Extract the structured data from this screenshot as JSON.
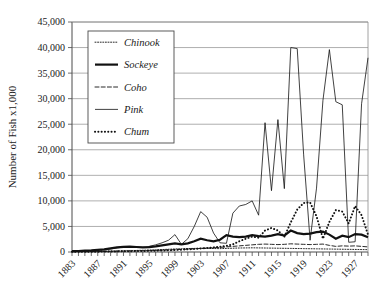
{
  "chart_data": {
    "type": "line",
    "title": "",
    "xlabel": "",
    "ylabel": "Number of Fish x1,000",
    "ylim": [
      0,
      45000
    ],
    "xlim": [
      1883,
      1929
    ],
    "ytick_labels": [
      "0",
      "5,000",
      "10,000",
      "15,000",
      "20,000",
      "25,000",
      "30,000",
      "35,000",
      "40,000",
      "45,000"
    ],
    "ytick_values": [
      0,
      5000,
      10000,
      15000,
      20000,
      25000,
      30000,
      35000,
      40000,
      45000
    ],
    "xtick_labels": [
      "1883",
      "1887",
      "1891",
      "1895",
      "1899",
      "1903",
      "1907",
      "1911",
      "1915",
      "1919",
      "1923",
      "1927"
    ],
    "xtick_values": [
      1883,
      1887,
      1891,
      1895,
      1899,
      1903,
      1907,
      1911,
      1915,
      1919,
      1923,
      1927
    ],
    "grid": true,
    "legend_position": "upper-left-inside",
    "x": [
      1883,
      1884,
      1885,
      1886,
      1887,
      1888,
      1889,
      1890,
      1891,
      1892,
      1893,
      1894,
      1895,
      1896,
      1897,
      1898,
      1899,
      1900,
      1901,
      1902,
      1903,
      1904,
      1905,
      1906,
      1907,
      1908,
      1909,
      1910,
      1911,
      1912,
      1913,
      1914,
      1915,
      1916,
      1917,
      1918,
      1919,
      1920,
      1921,
      1922,
      1923,
      1924,
      1925,
      1926,
      1927,
      1928,
      1929
    ],
    "series": [
      {
        "name": "Chinook",
        "style": "fine-dotted",
        "values": [
          80,
          90,
          100,
          120,
          140,
          160,
          180,
          200,
          230,
          260,
          300,
          340,
          380,
          420,
          480,
          540,
          600,
          640,
          680,
          700,
          720,
          700,
          680,
          660,
          700,
          740,
          780,
          800,
          820,
          800,
          780,
          760,
          740,
          720,
          700,
          680,
          660,
          640,
          620,
          600,
          580,
          560,
          540,
          520,
          500,
          480,
          460
        ]
      },
      {
        "name": "Sockeye",
        "style": "thick-solid",
        "values": [
          180,
          200,
          260,
          320,
          420,
          520,
          700,
          900,
          1000,
          1050,
          980,
          900,
          950,
          1100,
          1300,
          1500,
          1700,
          1500,
          1700,
          2100,
          2600,
          2300,
          2100,
          2400,
          3300,
          3000,
          2900,
          3000,
          3300,
          3100,
          3000,
          3200,
          3500,
          3200,
          4200,
          3700,
          3500,
          3600,
          3900,
          4000,
          3400,
          2600,
          3200,
          2900,
          3500,
          3400,
          2900
        ]
      },
      {
        "name": "Coho",
        "style": "dashed",
        "values": [
          40,
          50,
          60,
          70,
          90,
          110,
          130,
          150,
          170,
          190,
          210,
          240,
          280,
          320,
          360,
          400,
          450,
          500,
          560,
          620,
          700,
          760,
          820,
          900,
          1000,
          1100,
          1200,
          1300,
          1400,
          1500,
          1550,
          1500,
          1450,
          1500,
          1600,
          1550,
          1500,
          1450,
          1500,
          1550,
          1300,
          1100,
          1200,
          1150,
          1200,
          1100,
          1000
        ]
      },
      {
        "name": "Pink",
        "style": "thin-solid",
        "values": [
          100,
          130,
          180,
          250,
          350,
          450,
          600,
          800,
          950,
          1000,
          950,
          900,
          1100,
          1400,
          1800,
          2300,
          3400,
          1500,
          2600,
          5000,
          7900,
          6800,
          3700,
          1800,
          1700,
          7600,
          9000,
          9300,
          10000,
          7200,
          25300,
          12000,
          25900,
          12400,
          40000,
          39800,
          19000,
          2300,
          12500,
          29700,
          39600,
          29400,
          28800,
          1900,
          2000,
          29000,
          38000
        ]
      },
      {
        "name": "Chum",
        "style": "thick-dotted",
        "values": [
          30,
          40,
          50,
          60,
          70,
          80,
          100,
          120,
          140,
          160,
          180,
          200,
          230,
          260,
          300,
          340,
          400,
          450,
          520,
          600,
          700,
          800,
          900,
          1000,
          1200,
          1500,
          2100,
          2600,
          3000,
          2800,
          4200,
          4700,
          4200,
          3000,
          5800,
          8300,
          9600,
          9700,
          7000,
          2600,
          5900,
          8200,
          7900,
          5600,
          9000,
          7200,
          3400
        ]
      }
    ]
  },
  "legend": {
    "items": [
      {
        "label": "Chinook",
        "style": "fine-dotted"
      },
      {
        "label": "Sockeye",
        "style": "thick-solid"
      },
      {
        "label": "Coho",
        "style": "dashed"
      },
      {
        "label": "Pink",
        "style": "thin-solid"
      },
      {
        "label": "Chum",
        "style": "thick-dotted"
      }
    ]
  }
}
